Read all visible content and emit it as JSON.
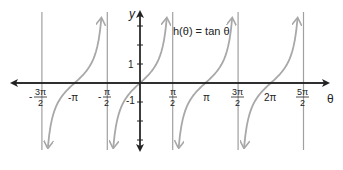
{
  "chart_data": {
    "type": "line",
    "title": "h(θ) = tan θ",
    "function": "tan",
    "xlabel": "θ",
    "ylabel": "y",
    "xlim": [
      -5.0,
      9.2
    ],
    "ylim": [
      -3.6,
      3.6
    ],
    "grid": false,
    "legend": null,
    "x_tick_labels": [
      "-3π/2",
      "-π",
      "-π/2",
      "π/2",
      "π",
      "3π/2",
      "2π",
      "5π/2"
    ],
    "x_tick_values": [
      -4.712,
      -3.1416,
      -1.5708,
      1.5708,
      3.1416,
      4.712,
      6.2832,
      7.854
    ],
    "y_tick_labels": [
      "1",
      "-1"
    ],
    "y_tick_values": [
      1,
      -1
    ],
    "asymptotes": [
      -4.712,
      -1.5708,
      1.5708,
      4.712,
      7.854
    ],
    "zeros": [
      -3.1416,
      0,
      3.1416,
      6.2832
    ],
    "series": [
      {
        "name": "h(θ) = tan θ",
        "branch_centers": [
          -3.1416,
          0,
          3.1416,
          6.2832
        ],
        "color": "#a8a8a8"
      }
    ]
  },
  "labels": {
    "function": "h(θ) = tan θ",
    "x_axis": "θ",
    "y_axis": "y",
    "y_one": "1",
    "y_neg_one": "-1",
    "neg_pi": "-π",
    "pi": "π",
    "two_pi": "2π",
    "neg_3pi_2_num": "3π",
    "neg_pi_2_num": "π",
    "pi_2_num": "π",
    "three_pi_2_num": "3π",
    "five_pi_2_num": "5π",
    "den": "2",
    "minus": "-"
  },
  "colors": {
    "curve": "#a8a8a8",
    "asymptote": "#a0a0a0",
    "axis": "#222222"
  }
}
